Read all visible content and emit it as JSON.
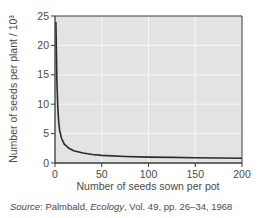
{
  "chart_data": {
    "type": "line",
    "title": "",
    "xlabel": "Number of seeds sown per pot",
    "ylabel": "Number of seeds per plant / 10³",
    "xlim": [
      0,
      200
    ],
    "ylim": [
      0,
      25
    ],
    "x_ticks": [
      0,
      50,
      100,
      150,
      200
    ],
    "y_ticks": [
      0,
      5,
      10,
      15,
      20,
      25
    ],
    "grid": true,
    "legend": null,
    "series": [
      {
        "name": "seeds per plant",
        "x": [
          1,
          2,
          3,
          4,
          5,
          7,
          10,
          15,
          20,
          30,
          40,
          50,
          75,
          100,
          125,
          150,
          175,
          200
        ],
        "y": [
          24,
          14,
          9.5,
          7,
          5.5,
          4.2,
          3.2,
          2.5,
          2.1,
          1.7,
          1.45,
          1.3,
          1.1,
          1.0,
          0.95,
          0.9,
          0.85,
          0.8
        ]
      }
    ],
    "colors": {
      "plot_bg": "#e3e3e3",
      "grid": "#f7f7f7",
      "line": "#2b2b2b",
      "axis": "#3a3a3a",
      "text": "#4a4a4a"
    }
  },
  "source": {
    "prefix": "Source",
    "author": ": Palmbald, ",
    "journal": "Ecology",
    "rest": ", Vol. 49, pp. 26–34, 1968"
  }
}
